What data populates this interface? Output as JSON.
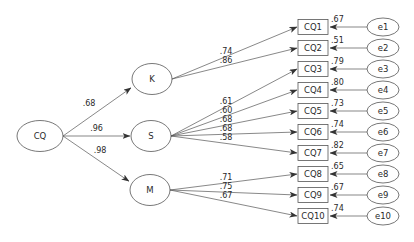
{
  "diagram": {
    "type": "structural-equation-model",
    "root": {
      "id": "CQ",
      "label": "CQ"
    },
    "factors": [
      {
        "id": "K",
        "label": "K",
        "loading_from_root": ".68"
      },
      {
        "id": "S",
        "label": "S",
        "loading_from_root": ".96"
      },
      {
        "id": "M",
        "label": "M",
        "loading_from_root": ".98"
      }
    ],
    "indicators": [
      {
        "id": "CQ1",
        "label": "CQ1",
        "factor": "K",
        "loading": ".74",
        "r2": ".67",
        "error": "e1"
      },
      {
        "id": "CQ2",
        "label": "CQ2",
        "factor": "K",
        "loading": ".86",
        "r2": ".51",
        "error": "e2"
      },
      {
        "id": "CQ3",
        "label": "CQ3",
        "factor": "S",
        "loading": ".61",
        "r2": ".79",
        "error": "e3"
      },
      {
        "id": "CQ4",
        "label": "CQ4",
        "factor": "S",
        "loading": ".60",
        "r2": ".80",
        "error": "e4"
      },
      {
        "id": "CQ5",
        "label": "CQ5",
        "factor": "S",
        "loading": ".68",
        "r2": ".73",
        "error": "e5"
      },
      {
        "id": "CQ6",
        "label": "CQ6",
        "factor": "S",
        "loading": ".68",
        "r2": ".74",
        "error": "e6"
      },
      {
        "id": "CQ7",
        "label": "CQ7",
        "factor": "S",
        "loading": ".58",
        "r2": ".82",
        "error": "e7"
      },
      {
        "id": "CQ8",
        "label": "CQ8",
        "factor": "M",
        "loading": ".71",
        "r2": ".65",
        "error": "e8"
      },
      {
        "id": "CQ9",
        "label": "CQ9",
        "factor": "M",
        "loading": ".75",
        "r2": ".67",
        "error": "e9"
      },
      {
        "id": "CQ10",
        "label": "CQ10",
        "factor": "M",
        "loading": ".67",
        "r2": ".74",
        "error": "e10"
      }
    ]
  }
}
